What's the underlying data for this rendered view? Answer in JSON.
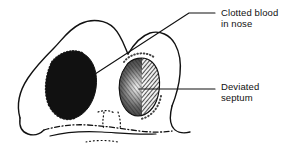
{
  "figure": {
    "subject": "nose",
    "view": "basal (worm's eye) view",
    "background_color": "#ffffff",
    "ink_color": "#111111",
    "width": 301,
    "height": 154
  },
  "callouts": [
    {
      "id": "clotted-blood",
      "line1": "Clotted blood",
      "line2": "in nose",
      "points_to": "left-nostril",
      "leader": {
        "type": "elbow",
        "from_x": 92,
        "from_y": 76,
        "bend_x": 189,
        "bend_y": 13,
        "to_x": 215,
        "to_y": 13
      }
    },
    {
      "id": "deviated-septum",
      "line1": "Deviated",
      "line2": "septum",
      "points_to": "right-nostril-septum",
      "leader": {
        "type": "straight",
        "from_x": 139,
        "from_y": 89,
        "bend_x": 139,
        "bend_y": 89,
        "to_x": 215,
        "to_y": 89
      }
    }
  ],
  "regions": [
    {
      "id": "left-nostril",
      "label": "left nostril filled with clotted blood",
      "fill": "solid-black",
      "border": "stippled"
    },
    {
      "id": "right-nostril",
      "label": "right nostril narrowed by deviated septum",
      "fill": "cross-hatched",
      "border": "stippled"
    },
    {
      "id": "nose-outline",
      "label": "outline of nose tip and alae",
      "fill": "none",
      "border": "solid"
    },
    {
      "id": "upper-lip",
      "label": "upper lip and philtrum",
      "fill": "none",
      "border": "dotted"
    }
  ]
}
